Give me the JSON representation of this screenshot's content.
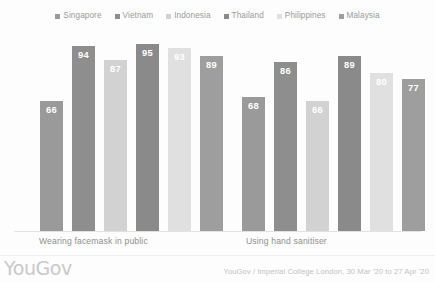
{
  "logo": "YouGov",
  "source": "YouGov / Imperial College London, 30 Mar '20 to 27 Apr '20",
  "legend": {
    "items": [
      {
        "label": "Singapore",
        "color": "#9a9a9a"
      },
      {
        "label": "Vietnam",
        "color": "#8e8e8e"
      },
      {
        "label": "Indonesia",
        "color": "#d2d2d2"
      },
      {
        "label": "Thailand",
        "color": "#8a8a8a"
      },
      {
        "label": "Philippines",
        "color": "#e0e0e0"
      },
      {
        "label": "Malaysia",
        "color": "#9e9e9e"
      }
    ]
  },
  "chart_data": {
    "type": "bar",
    "title": "",
    "subtitle": "",
    "xlabel": "",
    "ylabel": "",
    "ylim": [
      0,
      100
    ],
    "grid": false,
    "legend_position": "top",
    "categories": [
      "Wearing facemask in public",
      "Using hand sanitiser"
    ],
    "series": [
      {
        "name": "Singapore",
        "color": "#9a9a9a",
        "values": [
          66,
          68
        ]
      },
      {
        "name": "Vietnam",
        "color": "#8e8e8e",
        "values": [
          94,
          86
        ]
      },
      {
        "name": "Indonesia",
        "color": "#d2d2d2",
        "values": [
          87,
          66
        ]
      },
      {
        "name": "Thailand",
        "color": "#8a8a8a",
        "values": [
          95,
          89
        ]
      },
      {
        "name": "Philippines",
        "color": "#e0e0e0",
        "values": [
          93,
          80
        ]
      },
      {
        "name": "Malaysia",
        "color": "#9e9e9e",
        "values": [
          89,
          77
        ]
      }
    ]
  }
}
